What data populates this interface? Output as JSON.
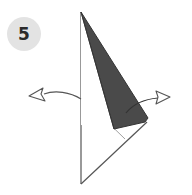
{
  "step": {
    "number": "5"
  },
  "colors": {
    "flap_fill": "#4a4a4a",
    "line": "#555555",
    "badge_bg": "#e3e3e3",
    "badge_text": "#2a2a2a"
  },
  "diagram": {
    "arrows": [
      {
        "name": "left-arrow",
        "direction": "left"
      },
      {
        "name": "right-arrow",
        "direction": "right"
      }
    ]
  }
}
